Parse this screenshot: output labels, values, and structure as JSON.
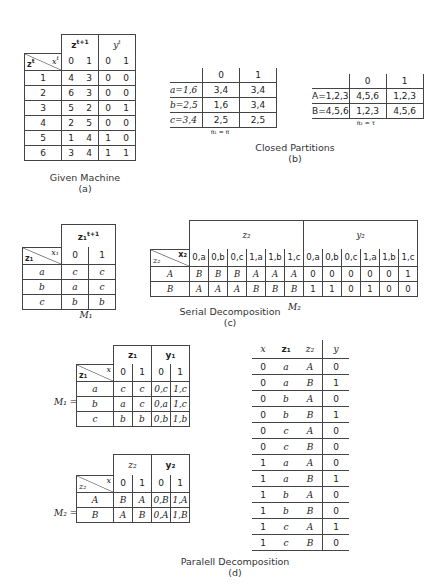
{
  "given_machine": {
    "hdr_state": "z",
    "hdr_input": "x",
    "hdr_next": "z",
    "hdr_out": "y",
    "sup_t": "t",
    "sup_t1": "t+1",
    "inputs": [
      "0",
      "1",
      "0",
      "1"
    ],
    "rows": [
      [
        "1",
        "4",
        "3",
        "0",
        "0"
      ],
      [
        "2",
        "6",
        "3",
        "0",
        "0"
      ],
      [
        "3",
        "5",
        "2",
        "0",
        "1"
      ],
      [
        "4",
        "2",
        "5",
        "0",
        "0"
      ],
      [
        "5",
        "1",
        "4",
        "1",
        "0"
      ],
      [
        "6",
        "3",
        "4",
        "1",
        "1"
      ]
    ],
    "caption": "Given Machine",
    "label": "(a)"
  },
  "pi1": {
    "inputs": [
      "0",
      "1"
    ],
    "rows": [
      [
        "a=1,6",
        "3,4",
        "3,4"
      ],
      [
        "b=2,5",
        "1,6",
        "3,4"
      ],
      [
        "c=3,4",
        "2,5",
        "2,5"
      ]
    ],
    "note": "π₁ = π"
  },
  "pi2": {
    "inputs": [
      "0",
      "1"
    ],
    "rows": [
      [
        "A=1,2,3",
        "4,5,6",
        "1,2,3"
      ],
      [
        "B=4,5,6",
        "1,2,3",
        "4,5,6"
      ]
    ],
    "note": "π₂ = τ"
  },
  "closed_partitions": {
    "caption": "Closed Partitions",
    "label": "(b)"
  },
  "m1_serial": {
    "hdr_next": "z₁",
    "sup_t1": "t+1",
    "hdr_state": "z₁",
    "hdr_input": "x₁",
    "inputs": [
      "0",
      "1"
    ],
    "rows": [
      [
        "a",
        "c",
        "c"
      ],
      [
        "b",
        "a",
        "c"
      ],
      [
        "c",
        "b",
        "b"
      ]
    ],
    "name": "M₁"
  },
  "m2_serial": {
    "hdr_next": "z₂",
    "hdr_out": "y₂",
    "hdr_state": "z₂",
    "hdr_input": "x₂",
    "inputs": [
      "0,a",
      "0,b",
      "0,c",
      "1,a",
      "1,b",
      "1,c",
      "0,a",
      "0,b",
      "0,c",
      "1,a",
      "1,b",
      "1,c"
    ],
    "rows": [
      [
        "A",
        "B",
        "B",
        "B",
        "A",
        "A",
        "A",
        "0",
        "0",
        "0",
        "0",
        "0",
        "1"
      ],
      [
        "B",
        "A",
        "A",
        "A",
        "B",
        "B",
        "B",
        "1",
        "1",
        "0",
        "1",
        "0",
        "0"
      ]
    ],
    "name": "M₂"
  },
  "serial": {
    "caption": "Serial Decomposition",
    "label": "(c)"
  },
  "m1_parallel": {
    "eq": "M₁ =",
    "hdr_next": "z₁",
    "hdr_out": "y₁",
    "hdr_state": "z₁",
    "hdr_input": "x",
    "inputs": [
      "0",
      "1",
      "0",
      "1"
    ],
    "rows": [
      [
        "a",
        "c",
        "c",
        "0,c",
        "1,c"
      ],
      [
        "b",
        "a",
        "c",
        "0,a",
        "1,c"
      ],
      [
        "c",
        "b",
        "b",
        "0,b",
        "1,b"
      ]
    ]
  },
  "m2_parallel": {
    "eq": "M₂ =",
    "hdr_next": "z₂",
    "hdr_out": "y₂",
    "hdr_state": "z₂",
    "hdr_input": "x",
    "inputs": [
      "0",
      "1",
      "0",
      "1"
    ],
    "rows": [
      [
        "A",
        "B",
        "A",
        "0,B",
        "1,A"
      ],
      [
        "B",
        "A",
        "B",
        "0,A",
        "1,B"
      ]
    ]
  },
  "output_table": {
    "headers": [
      "x",
      "z₁",
      "z₂",
      "y"
    ],
    "rows": [
      [
        "0",
        "a",
        "A",
        "0"
      ],
      [
        "0",
        "a",
        "B",
        "1"
      ],
      [
        "0",
        "b",
        "A",
        "0"
      ],
      [
        "0",
        "b",
        "B",
        "1"
      ],
      [
        "0",
        "c",
        "A",
        "0"
      ],
      [
        "0",
        "c",
        "B",
        "0"
      ],
      [
        "1",
        "a",
        "A",
        "0"
      ],
      [
        "1",
        "a",
        "B",
        "1"
      ],
      [
        "1",
        "b",
        "A",
        "0"
      ],
      [
        "1",
        "b",
        "B",
        "0"
      ],
      [
        "1",
        "c",
        "A",
        "1"
      ],
      [
        "1",
        "c",
        "B",
        "0"
      ]
    ]
  },
  "parallel": {
    "caption": "Paralell Decomposition",
    "label": "(d)"
  }
}
